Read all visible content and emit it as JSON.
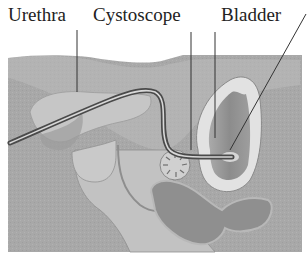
{
  "diagram": {
    "type": "anatomical-illustration",
    "labels": [
      {
        "text": "Urethra",
        "x": 8
      },
      {
        "text": "Cystoscope",
        "x": 93
      },
      {
        "text": "Bladder",
        "x": 221
      }
    ],
    "colors": {
      "background": "#a9a9a9",
      "tissue_light": "#c8c8c8",
      "tissue_mid": "#b4b4b4",
      "organ_dark": "#8e8e8e",
      "bladder_wall": "#e4e4e4",
      "bladder_inner": "#9a9a9a",
      "scope": "#555555",
      "leader_line": "#333333",
      "text": "#222222"
    }
  }
}
